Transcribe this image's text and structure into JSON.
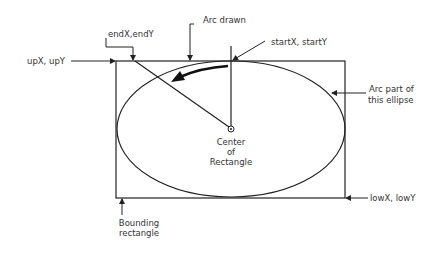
{
  "labels": {
    "arc_drawn": "Arc drawn",
    "end_point": "endX,endY",
    "start_point": "startX, startY",
    "up_point": "upX, upY",
    "arc_ellipse_line1": "Arc part of",
    "arc_ellipse_line2": "this ellipse",
    "center_line1": "Center",
    "center_line2": "of",
    "center_line3": "Rectangle",
    "low_point": "lowX, lowY",
    "bounding_line1": "Bounding",
    "bounding_line2": "rectangle"
  },
  "geometry": {
    "rect": {
      "x": 116,
      "y": 61,
      "width": 229,
      "height": 137
    },
    "ellipse": {
      "cx": 231,
      "cy": 129,
      "rx": 114,
      "ry": 68
    },
    "center": {
      "x": 231,
      "y": 129
    }
  },
  "colors": {
    "stroke": "#222222",
    "text": "#333333",
    "background": "#ffffff"
  }
}
